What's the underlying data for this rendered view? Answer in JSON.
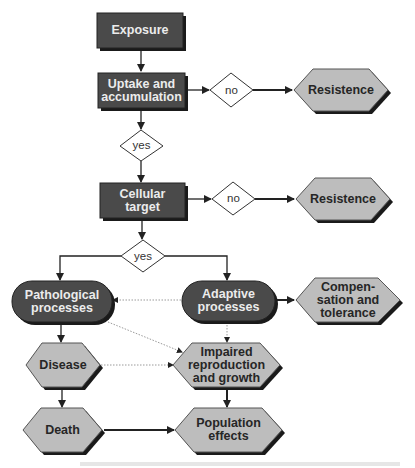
{
  "colors": {
    "dark_box": "#4a4a4a",
    "light_hex": "#bdbdbd",
    "shadow": "#1a1a1a",
    "line": "#222222",
    "dotted_line": "#9a9a9a",
    "background": "#ffffff"
  },
  "nodes": {
    "exposure": {
      "label": "Exposure",
      "shape": "rectangle"
    },
    "uptake": {
      "label": "Uptake and\naccumulation",
      "shape": "rectangle"
    },
    "decision_uptake_no": {
      "label": "no",
      "shape": "diamond"
    },
    "resistence_1": {
      "label": "Resistence",
      "shape": "hexagon"
    },
    "decision_uptake_yes": {
      "label": "yes",
      "shape": "diamond"
    },
    "cellular_target": {
      "label": "Cellular\ntarget",
      "shape": "rectangle"
    },
    "decision_cellular_no": {
      "label": "no",
      "shape": "diamond"
    },
    "resistence_2": {
      "label": "Resistence",
      "shape": "hexagon"
    },
    "decision_cellular_yes": {
      "label": "yes",
      "shape": "diamond"
    },
    "pathological": {
      "label": "Pathological\nprocesses",
      "shape": "rounded"
    },
    "adaptive": {
      "label": "Adaptive\nprocesses",
      "shape": "rounded"
    },
    "compensation": {
      "label": "Compen-\nsation and\ntolerance",
      "shape": "hexagon"
    },
    "disease": {
      "label": "Disease",
      "shape": "hexagon"
    },
    "impaired": {
      "label": "Impaired\nreproduction\nand growth",
      "shape": "hexagon"
    },
    "death": {
      "label": "Death",
      "shape": "hexagon"
    },
    "population": {
      "label": "Population\neffects",
      "shape": "hexagon"
    }
  },
  "edges": [
    {
      "from": "exposure",
      "to": "uptake",
      "style": "solid"
    },
    {
      "from": "uptake",
      "to": "decision_uptake_no",
      "style": "solid"
    },
    {
      "from": "decision_uptake_no",
      "to": "resistence_1",
      "style": "solid"
    },
    {
      "from": "uptake",
      "to": "decision_uptake_yes",
      "style": "solid"
    },
    {
      "from": "decision_uptake_yes",
      "to": "cellular_target",
      "style": "solid"
    },
    {
      "from": "cellular_target",
      "to": "decision_cellular_no",
      "style": "solid"
    },
    {
      "from": "decision_cellular_no",
      "to": "resistence_2",
      "style": "solid"
    },
    {
      "from": "cellular_target",
      "to": "decision_cellular_yes",
      "style": "solid"
    },
    {
      "from": "decision_cellular_yes",
      "to": "pathological",
      "style": "solid"
    },
    {
      "from": "decision_cellular_yes",
      "to": "adaptive",
      "style": "solid"
    },
    {
      "from": "adaptive",
      "to": "pathological",
      "style": "dotted"
    },
    {
      "from": "adaptive",
      "to": "compensation",
      "style": "solid"
    },
    {
      "from": "adaptive",
      "to": "impaired",
      "style": "dotted"
    },
    {
      "from": "pathological",
      "to": "impaired",
      "style": "dotted"
    },
    {
      "from": "pathological",
      "to": "disease",
      "style": "solid"
    },
    {
      "from": "disease",
      "to": "impaired",
      "style": "dotted"
    },
    {
      "from": "disease",
      "to": "death",
      "style": "solid"
    },
    {
      "from": "impaired",
      "to": "population",
      "style": "solid"
    },
    {
      "from": "death",
      "to": "population",
      "style": "solid"
    }
  ]
}
